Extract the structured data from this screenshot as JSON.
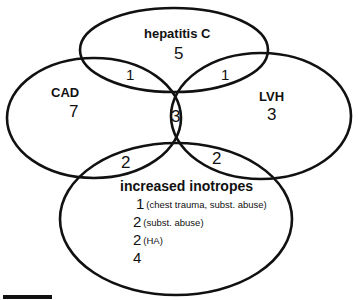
{
  "sets": {
    "hepatitis_c": {
      "label": "hepatitis C",
      "only": "5"
    },
    "cad": {
      "label": "CAD",
      "only": "7"
    },
    "lvh": {
      "label": "LVH",
      "only": "3"
    },
    "inotropes": {
      "label": "increased inotropes"
    }
  },
  "intersections": {
    "cad_hepc": "1",
    "hepc_lvh": "1",
    "cad_hepc_lvh_inotropes": "3",
    "cad_inotropes": "2",
    "lvh_inotropes": "2"
  },
  "inotropes_breakdown": [
    {
      "count": "1",
      "note": "(chest trauma, subst. abuse)"
    },
    {
      "count": "2",
      "note": "(subst. abuse)"
    },
    {
      "count": "2",
      "note": "(HA)"
    },
    {
      "count": "4",
      "note": ""
    }
  ],
  "colors": {
    "stroke": "#111111",
    "background": "#ffffff"
  }
}
